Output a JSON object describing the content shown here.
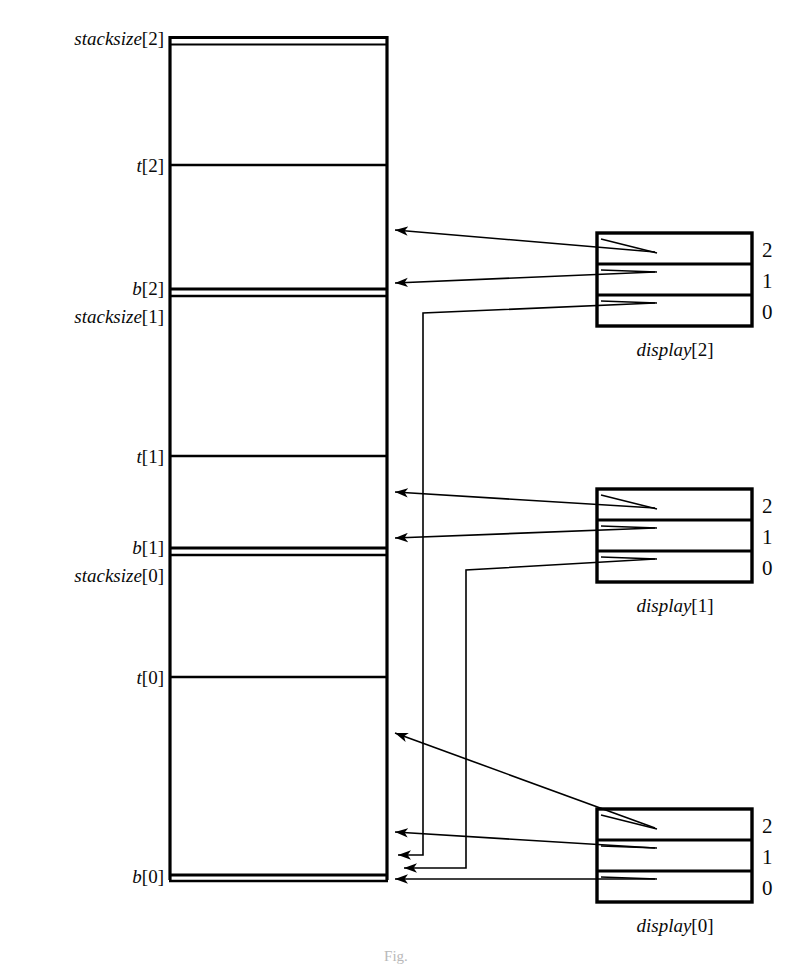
{
  "figure": {
    "caption": "Fig."
  },
  "stack": {
    "name": "stack",
    "boundaries": [
      {
        "id": "stacksize-2",
        "var": "stacksize",
        "index": "[2]",
        "y": 38,
        "double": true
      },
      {
        "id": "t-2",
        "var": "t",
        "index": "[2]",
        "y": 165,
        "double": false
      },
      {
        "id": "b-2",
        "var": "b",
        "index": "[2]",
        "y": 290,
        "double": true
      },
      {
        "id": "stacksize-1",
        "var": "stacksize",
        "index": "[1]",
        "y": 315,
        "double": false
      },
      {
        "id": "t-1",
        "var": "t",
        "index": "[1]",
        "y": 456,
        "double": false
      },
      {
        "id": "b-1",
        "var": "b",
        "index": "[1]",
        "y": 549,
        "double": true
      },
      {
        "id": "stacksize-0",
        "var": "stacksize",
        "index": "[0]",
        "y": 574,
        "double": false
      },
      {
        "id": "t-0",
        "var": "t",
        "index": "[0]",
        "y": 677,
        "double": false
      },
      {
        "id": "b-0",
        "var": "b",
        "index": "[0]",
        "y": 876,
        "double": true
      }
    ]
  },
  "displays": [
    {
      "id": "display-2",
      "var": "display",
      "index": "[2]",
      "caption_var": "display",
      "caption_index": "[2]",
      "slots": [
        {
          "label": "2",
          "points_to": "t-2"
        },
        {
          "label": "1",
          "points_to": "b-2"
        },
        {
          "label": "0",
          "points_to": "b-0"
        }
      ]
    },
    {
      "id": "display-1",
      "var": "display",
      "index": "[1]",
      "caption_var": "display",
      "caption_index": "[1]",
      "slots": [
        {
          "label": "2",
          "points_to": "t-1"
        },
        {
          "label": "1",
          "points_to": "b-1"
        },
        {
          "label": "0",
          "points_to": "b-0"
        }
      ]
    },
    {
      "id": "display-0",
      "var": "display",
      "index": "[0]",
      "caption_var": "display",
      "caption_index": "[0]",
      "slots": [
        {
          "label": "2",
          "points_to": "t-0"
        },
        {
          "label": "1",
          "points_to": "b-0"
        },
        {
          "label": "0",
          "points_to": "b-0"
        }
      ]
    }
  ],
  "labels": {
    "stacksize_2": "stacksize",
    "b_2": "b",
    "t_2": "t"
  },
  "colors": {
    "ink": "#000000",
    "paper": "#ffffff",
    "caption": "#b9b9b9"
  }
}
